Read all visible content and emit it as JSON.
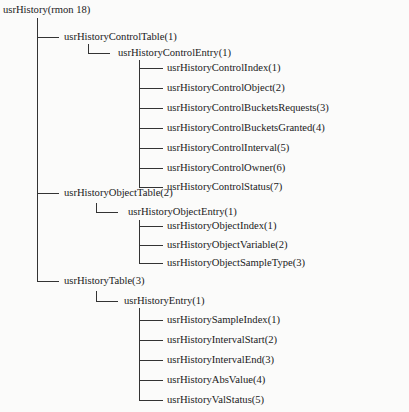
{
  "diagram": {
    "root": {
      "label": "usrHistory(rmon 18)",
      "children": [
        {
          "label": "usrHistoryControlTable(1)",
          "children": [
            {
              "label": "usrHistoryControlEntry(1)",
              "children": [
                {
                  "label": "usrHistoryControlIndex(1)"
                },
                {
                  "label": "usrHistoryControlObject(2)"
                },
                {
                  "label": "usrHistoryControlBucketsRequests(3)"
                },
                {
                  "label": "usrHistoryControlBucketsGranted(4)"
                },
                {
                  "label": "usrHistoryControlInterval(5)"
                },
                {
                  "label": "usrHistoryControlOwner(6)"
                },
                {
                  "label": "usrHistoryControlStatus(7)"
                }
              ]
            }
          ]
        },
        {
          "label": "usrHistoryObjectTable(2)",
          "children": [
            {
              "label": "usrHistoryObjectEntry(1)",
              "children": [
                {
                  "label": "usrHistoryObjectIndex(1)"
                },
                {
                  "label": "usrHistoryObjectVariable(2)"
                },
                {
                  "label": "usrHistoryObjectSampleType(3)"
                }
              ]
            }
          ]
        },
        {
          "label": "usrHistoryTable(3)",
          "children": [
            {
              "label": "usrHistoryEntry(1)",
              "children": [
                {
                  "label": "usrHistorySampleIndex(1)"
                },
                {
                  "label": "usrHistoryIntervalStart(2)"
                },
                {
                  "label": "usrHistoryIntervalEnd(3)"
                },
                {
                  "label": "usrHistoryAbsValue(4)"
                },
                {
                  "label": "usrHistoryValStatus(5)"
                }
              ]
            }
          ]
        }
      ]
    }
  }
}
